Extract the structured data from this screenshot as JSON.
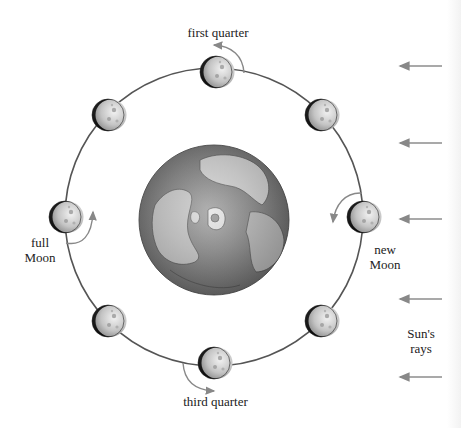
{
  "diagram": {
    "labels": {
      "first_quarter": "first quarter",
      "third_quarter": "third quarter",
      "full_moon_1": "full",
      "full_moon_2": "Moon",
      "new_moon_1": "new",
      "new_moon_2": "Moon",
      "sun_rays_1": "Sun's",
      "sun_rays_2": "rays"
    },
    "colors": {
      "orbit": "#555555",
      "arrow": "#888888",
      "earth_ocean": "#7a7a7a",
      "earth_land": "#cfcfcf",
      "moon_dark": "#111111",
      "moon_lit": "#d8d8d8"
    },
    "earth": {
      "cx": 214,
      "cy": 220,
      "r": 75
    },
    "orbit": {
      "cx": 214,
      "cy": 217,
      "r": 149
    },
    "moons": [
      {
        "name": "first-quarter",
        "x": 216,
        "y": 72
      },
      {
        "name": "waxing-gibbous",
        "x": 108,
        "y": 115
      },
      {
        "name": "waxing-crescent",
        "x": 321,
        "y": 115
      },
      {
        "name": "full-moon",
        "x": 65,
        "y": 217
      },
      {
        "name": "new-moon",
        "x": 363,
        "y": 217
      },
      {
        "name": "waning-gibbous",
        "x": 108,
        "y": 321
      },
      {
        "name": "waning-crescent",
        "x": 321,
        "y": 321
      },
      {
        "name": "third-quarter",
        "x": 214,
        "y": 363
      }
    ],
    "sun_ray_arrows_y": [
      66,
      143,
      219,
      299,
      377
    ]
  }
}
